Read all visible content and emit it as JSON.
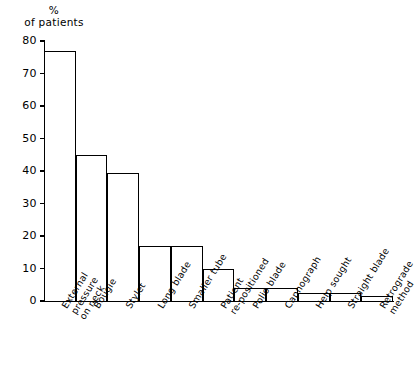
{
  "chart_data": {
    "type": "bar",
    "title": "",
    "subtitle": "",
    "ylabel_lines": [
      "%",
      "of patients"
    ],
    "xlabel": "",
    "ylim": [
      0,
      80
    ],
    "yticks": [
      0,
      10,
      20,
      30,
      40,
      50,
      60,
      70,
      80
    ],
    "ytick_labels": [
      "0",
      "10",
      "20",
      "30",
      "40",
      "50",
      "60",
      "70",
      "80"
    ],
    "grid": false,
    "legend": "none",
    "categories": [
      "External pressure on neck",
      "Bougie",
      "Stylet",
      "Long blade",
      "Smaller tube",
      "Patient re-positioned",
      "Polio blade",
      "Capnograph",
      "Help sought",
      "Straight blade",
      "Retrograde method"
    ],
    "category_lines": [
      [
        "External",
        "pressure",
        "on neck"
      ],
      [
        "Bougie"
      ],
      [
        "Stylet"
      ],
      [
        "Long blade"
      ],
      [
        "Smaller tube"
      ],
      [
        "Patient",
        "re-positioned"
      ],
      [
        "Polio blade"
      ],
      [
        "Capnograph"
      ],
      [
        "Help sought"
      ],
      [
        "Straight blade"
      ],
      [
        "Retrograde",
        "method"
      ]
    ],
    "values": [
      77,
      45,
      39.5,
      17,
      17,
      10,
      4,
      4,
      2.5,
      2.5,
      1.5
    ],
    "bar_color": "#ffffff",
    "bar_edge_color": "#000000",
    "axis_color": "#000000",
    "background_color": "#ffffff"
  }
}
